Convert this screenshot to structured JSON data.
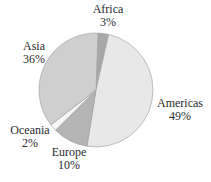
{
  "chart_data": {
    "type": "pie",
    "title": "",
    "categories": [
      "Africa",
      "Americas",
      "Europe",
      "Oceania",
      "Asia"
    ],
    "values": [
      3,
      49,
      10,
      2,
      36
    ],
    "unit": "%",
    "colors": [
      "#a8a8a8",
      "#e8e8e8",
      "#b4b4b4",
      "#f6f6f6",
      "#cfcfcf"
    ],
    "start_angle_deg": 2,
    "direction": "clockwise"
  },
  "labels": {
    "africa": {
      "name": "Africa",
      "pct": "3%"
    },
    "americas": {
      "name": "Americas",
      "pct": "49%"
    },
    "europe": {
      "name": "Europe",
      "pct": "10%"
    },
    "oceania": {
      "name": "Oceania",
      "pct": "2%"
    },
    "asia": {
      "name": "Asia",
      "pct": "36%"
    }
  }
}
